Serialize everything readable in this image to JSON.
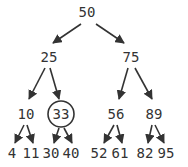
{
  "diagram": {
    "type": "binary-search-tree",
    "colors": {
      "ink": "#333333",
      "background": "#ffffff"
    },
    "highlighted_node": "33",
    "nodes": [
      {
        "id": "n50",
        "label": "50",
        "x": 87,
        "y": 17,
        "parent": null
      },
      {
        "id": "n25",
        "label": "25",
        "x": 49,
        "y": 62,
        "parent": "n50"
      },
      {
        "id": "n75",
        "label": "75",
        "x": 131,
        "y": 62,
        "parent": "n50"
      },
      {
        "id": "n10",
        "label": "10",
        "x": 26,
        "y": 119,
        "parent": "n25"
      },
      {
        "id": "n33",
        "label": "33",
        "x": 61,
        "y": 119,
        "parent": "n25",
        "highlighted": true
      },
      {
        "id": "n56",
        "label": "56",
        "x": 116,
        "y": 119,
        "parent": "n75"
      },
      {
        "id": "n89",
        "label": "89",
        "x": 154,
        "y": 119,
        "parent": "n75"
      },
      {
        "id": "n4",
        "label": "4",
        "x": 12,
        "y": 158,
        "parent": "n10"
      },
      {
        "id": "n11",
        "label": "11",
        "x": 31,
        "y": 158,
        "parent": "n10"
      },
      {
        "id": "n30",
        "label": "30",
        "x": 51,
        "y": 158,
        "parent": "n33"
      },
      {
        "id": "n40",
        "label": "40",
        "x": 71,
        "y": 158,
        "parent": "n33"
      },
      {
        "id": "n52",
        "label": "52",
        "x": 99,
        "y": 158,
        "parent": "n56"
      },
      {
        "id": "n61",
        "label": "61",
        "x": 120,
        "y": 158,
        "parent": "n56"
      },
      {
        "id": "n82",
        "label": "82",
        "x": 145,
        "y": 158,
        "parent": "n89"
      },
      {
        "id": "n95",
        "label": "95",
        "x": 166,
        "y": 158,
        "parent": "n89"
      }
    ],
    "edges": [
      {
        "from": "n50",
        "to": "n25",
        "x1": 81,
        "y1": 24,
        "x2": 53,
        "y2": 43
      },
      {
        "from": "n50",
        "to": "n75",
        "x1": 96,
        "y1": 24,
        "x2": 124,
        "y2": 43
      },
      {
        "from": "n25",
        "to": "n10",
        "x1": 45,
        "y1": 68,
        "x2": 29,
        "y2": 99
      },
      {
        "from": "n25",
        "to": "n33",
        "x1": 50,
        "y1": 68,
        "x2": 59,
        "y2": 99
      },
      {
        "from": "n75",
        "to": "n56",
        "x1": 128,
        "y1": 68,
        "x2": 119,
        "y2": 99
      },
      {
        "from": "n75",
        "to": "n89",
        "x1": 135,
        "y1": 68,
        "x2": 152,
        "y2": 99
      },
      {
        "from": "n10",
        "to": "n4",
        "x1": 24,
        "y1": 125,
        "x2": 15,
        "y2": 143
      },
      {
        "from": "n10",
        "to": "n11",
        "x1": 27,
        "y1": 125,
        "x2": 33,
        "y2": 143
      },
      {
        "from": "n33",
        "to": "n30",
        "x1": 59,
        "y1": 128,
        "x2": 54,
        "y2": 143
      },
      {
        "from": "n33",
        "to": "n40",
        "x1": 64,
        "y1": 128,
        "x2": 72,
        "y2": 143
      },
      {
        "from": "n56",
        "to": "n52",
        "x1": 114,
        "y1": 125,
        "x2": 104,
        "y2": 143
      },
      {
        "from": "n56",
        "to": "n61",
        "x1": 117,
        "y1": 125,
        "x2": 122,
        "y2": 143
      },
      {
        "from": "n89",
        "to": "n82",
        "x1": 152,
        "y1": 125,
        "x2": 148,
        "y2": 143
      },
      {
        "from": "n89",
        "to": "n95",
        "x1": 155,
        "y1": 125,
        "x2": 164,
        "y2": 143
      }
    ]
  }
}
